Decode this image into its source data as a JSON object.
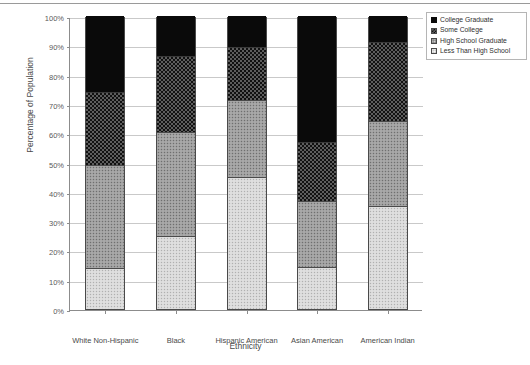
{
  "chart_data": {
    "type": "bar",
    "stacked": true,
    "stack_mode": "percent",
    "title": "",
    "xlabel": "Ethnicity",
    "ylabel": "Percentage of Population",
    "ylim": [
      0,
      100
    ],
    "ytick_labels": [
      "0%",
      "10%",
      "20%",
      "30%",
      "40%",
      "50%",
      "60%",
      "70%",
      "80%",
      "90%",
      "100%"
    ],
    "ytick_values": [
      0,
      10,
      20,
      30,
      40,
      50,
      60,
      70,
      80,
      90,
      100
    ],
    "grid": true,
    "legend_position": "top-right",
    "categories": [
      "White Non-Hispanic",
      "Black",
      "Hispanic American",
      "Asian American",
      "American Indian"
    ],
    "series": [
      {
        "name": "College Graduate",
        "pattern": "solid-black",
        "color": "#0a0a0a",
        "values": [
          26,
          13.5,
          10.5,
          43,
          9
        ]
      },
      {
        "name": "Some College",
        "pattern": "dark-checkerboard",
        "color": "#5d5d5d",
        "values": [
          25,
          26,
          18,
          20,
          27
        ]
      },
      {
        "name": "High School Graduate",
        "pattern": "medium-gray-stipple",
        "color": "#9e9e9e",
        "values": [
          35,
          35.5,
          26.5,
          22.5,
          29
        ]
      },
      {
        "name": "Less Than High School",
        "pattern": "light-gray-stipple",
        "color": "#d9d9d9",
        "values": [
          14,
          25,
          45,
          14.5,
          35
        ]
      }
    ],
    "cumulative_tops": [
      [
        14,
        49,
        74,
        100
      ],
      [
        25,
        60.5,
        86.5,
        100
      ],
      [
        45,
        71.5,
        89.5,
        100
      ],
      [
        14.5,
        37,
        57,
        100
      ],
      [
        35,
        64,
        91,
        100
      ]
    ]
  }
}
